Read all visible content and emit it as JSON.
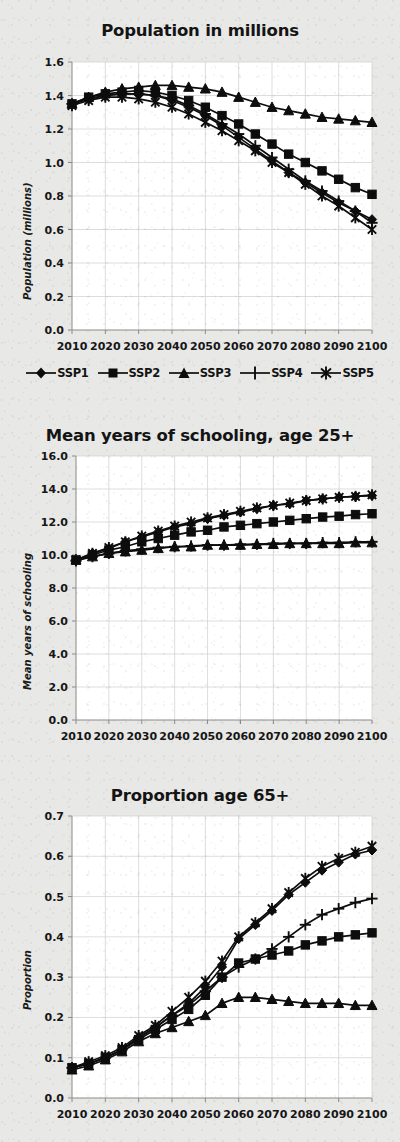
{
  "figure": {
    "background_color": "#e8e8e6",
    "ink_color": "#0d0d0d",
    "grid_color": "#cfcfcf"
  },
  "legend": {
    "position": "below-first-panel",
    "items": [
      {
        "label": "SSP1",
        "marker": "diamond"
      },
      {
        "label": "SSP2",
        "marker": "square"
      },
      {
        "label": "SSP3",
        "marker": "triangle"
      },
      {
        "label": "SSP4",
        "marker": "plus"
      },
      {
        "label": "SSP5",
        "marker": "asterisk"
      }
    ]
  },
  "chart_data": [
    {
      "type": "line",
      "title": "Population in millions",
      "xlabel": "",
      "ylabel": "Population (millions)",
      "x": [
        2010,
        2015,
        2020,
        2025,
        2030,
        2035,
        2040,
        2045,
        2050,
        2055,
        2060,
        2065,
        2070,
        2075,
        2080,
        2085,
        2090,
        2095,
        2100
      ],
      "tick_labels_x": [
        "2010",
        "2020",
        "2030",
        "2040",
        "2050",
        "2060",
        "2070",
        "2080",
        "2090",
        "2100"
      ],
      "tick_labels_y": [
        "0.0",
        "0.2",
        "0.4",
        "0.6",
        "0.8",
        "1.0",
        "1.2",
        "1.4",
        "1.6"
      ],
      "xlim": [
        2010,
        2100
      ],
      "ylim": [
        0.0,
        1.6
      ],
      "ytick_step": 0.2,
      "grid": true,
      "series": [
        {
          "name": "SSP1",
          "marker": "diamond",
          "values": [
            1.35,
            1.38,
            1.4,
            1.41,
            1.41,
            1.4,
            1.37,
            1.33,
            1.28,
            1.22,
            1.15,
            1.08,
            1.01,
            0.94,
            0.88,
            0.82,
            0.76,
            0.71,
            0.66
          ]
        },
        {
          "name": "SSP2",
          "marker": "square",
          "values": [
            1.35,
            1.39,
            1.41,
            1.42,
            1.43,
            1.42,
            1.4,
            1.37,
            1.33,
            1.28,
            1.23,
            1.17,
            1.11,
            1.05,
            1.0,
            0.95,
            0.9,
            0.85,
            0.81
          ]
        },
        {
          "name": "SSP3",
          "marker": "triangle",
          "values": [
            1.35,
            1.39,
            1.42,
            1.44,
            1.45,
            1.46,
            1.46,
            1.45,
            1.44,
            1.42,
            1.39,
            1.36,
            1.33,
            1.31,
            1.29,
            1.27,
            1.26,
            1.25,
            1.24
          ]
        },
        {
          "name": "SSP4",
          "marker": "plus",
          "values": [
            1.35,
            1.38,
            1.4,
            1.41,
            1.41,
            1.4,
            1.38,
            1.34,
            1.29,
            1.23,
            1.17,
            1.1,
            1.03,
            0.96,
            0.89,
            0.83,
            0.77,
            0.71,
            0.64
          ]
        },
        {
          "name": "SSP5",
          "marker": "asterisk",
          "values": [
            1.34,
            1.37,
            1.39,
            1.39,
            1.38,
            1.36,
            1.33,
            1.29,
            1.24,
            1.19,
            1.13,
            1.07,
            1.0,
            0.94,
            0.87,
            0.8,
            0.74,
            0.67,
            0.6
          ]
        }
      ]
    },
    {
      "type": "line",
      "title": "Mean years of schooling, age 25+",
      "xlabel": "",
      "ylabel": "Mean years of schooling",
      "x": [
        2010,
        2015,
        2020,
        2025,
        2030,
        2035,
        2040,
        2045,
        2050,
        2055,
        2060,
        2065,
        2070,
        2075,
        2080,
        2085,
        2090,
        2095,
        2100
      ],
      "tick_labels_x": [
        "2010",
        "2020",
        "2030",
        "2040",
        "2050",
        "2060",
        "2070",
        "2080",
        "2090",
        "2100"
      ],
      "tick_labels_y": [
        "0.0",
        "2.0",
        "4.0",
        "6.0",
        "8.0",
        "10.0",
        "12.0",
        "14.0",
        "16.0"
      ],
      "xlim": [
        2010,
        2100
      ],
      "ylim": [
        0.0,
        16.0
      ],
      "ytick_step": 2.0,
      "grid": true,
      "series": [
        {
          "name": "SSP1",
          "marker": "diamond",
          "values": [
            9.7,
            10.1,
            10.4,
            10.8,
            11.1,
            11.4,
            11.7,
            11.9,
            12.2,
            12.4,
            12.6,
            12.8,
            13.0,
            13.1,
            13.3,
            13.4,
            13.5,
            13.55,
            13.6
          ]
        },
        {
          "name": "SSP2",
          "marker": "square",
          "values": [
            9.7,
            10.0,
            10.3,
            10.5,
            10.8,
            11.0,
            11.2,
            11.4,
            11.5,
            11.7,
            11.8,
            11.9,
            12.0,
            12.1,
            12.2,
            12.3,
            12.35,
            12.45,
            12.5
          ]
        },
        {
          "name": "SSP3",
          "marker": "triangle",
          "values": [
            9.7,
            9.9,
            10.1,
            10.2,
            10.3,
            10.4,
            10.5,
            10.5,
            10.6,
            10.6,
            10.6,
            10.65,
            10.65,
            10.7,
            10.7,
            10.7,
            10.7,
            10.75,
            10.75
          ]
        },
        {
          "name": "SSP4",
          "marker": "plus",
          "values": [
            9.65,
            9.9,
            10.1,
            10.25,
            10.35,
            10.45,
            10.5,
            10.55,
            10.6,
            10.6,
            10.65,
            10.65,
            10.7,
            10.7,
            10.7,
            10.75,
            10.75,
            10.8,
            10.8
          ]
        },
        {
          "name": "SSP5",
          "marker": "asterisk",
          "values": [
            9.7,
            10.1,
            10.45,
            10.8,
            11.15,
            11.45,
            11.75,
            12.0,
            12.25,
            12.45,
            12.65,
            12.85,
            13.0,
            13.15,
            13.3,
            13.4,
            13.5,
            13.55,
            13.65
          ]
        }
      ]
    },
    {
      "type": "line",
      "title": "Proportion age 65+",
      "xlabel": "",
      "ylabel": "Proportion",
      "x": [
        2010,
        2015,
        2020,
        2025,
        2030,
        2035,
        2040,
        2045,
        2050,
        2055,
        2060,
        2065,
        2070,
        2075,
        2080,
        2085,
        2090,
        2095,
        2100
      ],
      "tick_labels_x": [
        "2010",
        "2020",
        "2030",
        "2040",
        "2050",
        "2060",
        "2070",
        "2080",
        "2090",
        "2100"
      ],
      "tick_labels_y": [
        "0.0",
        "0.1",
        "0.2",
        "0.3",
        "0.4",
        "0.5",
        "0.6",
        "0.7"
      ],
      "xlim": [
        2010,
        2100
      ],
      "ylim": [
        0.0,
        0.7
      ],
      "ytick_step": 0.1,
      "grid": true,
      "series": [
        {
          "name": "SSP1",
          "marker": "diamond",
          "values": [
            0.075,
            0.085,
            0.1,
            0.12,
            0.15,
            0.175,
            0.205,
            0.235,
            0.275,
            0.325,
            0.395,
            0.43,
            0.465,
            0.505,
            0.535,
            0.565,
            0.585,
            0.605,
            0.615
          ]
        },
        {
          "name": "SSP2",
          "marker": "square",
          "values": [
            0.075,
            0.085,
            0.1,
            0.12,
            0.145,
            0.17,
            0.195,
            0.22,
            0.255,
            0.3,
            0.335,
            0.345,
            0.355,
            0.365,
            0.38,
            0.39,
            0.4,
            0.405,
            0.41
          ]
        },
        {
          "name": "SSP3",
          "marker": "triangle",
          "values": [
            0.07,
            0.08,
            0.095,
            0.115,
            0.14,
            0.16,
            0.175,
            0.19,
            0.205,
            0.235,
            0.25,
            0.25,
            0.245,
            0.24,
            0.235,
            0.235,
            0.235,
            0.23,
            0.23
          ]
        },
        {
          "name": "SSP4",
          "marker": "plus",
          "values": [
            0.075,
            0.085,
            0.1,
            0.12,
            0.15,
            0.175,
            0.205,
            0.23,
            0.265,
            0.3,
            0.325,
            0.345,
            0.37,
            0.4,
            0.43,
            0.455,
            0.47,
            0.485,
            0.495
          ]
        },
        {
          "name": "SSP5",
          "marker": "asterisk",
          "values": [
            0.075,
            0.09,
            0.105,
            0.125,
            0.155,
            0.18,
            0.215,
            0.25,
            0.29,
            0.34,
            0.4,
            0.435,
            0.47,
            0.51,
            0.545,
            0.575,
            0.595,
            0.61,
            0.625
          ]
        }
      ]
    }
  ]
}
